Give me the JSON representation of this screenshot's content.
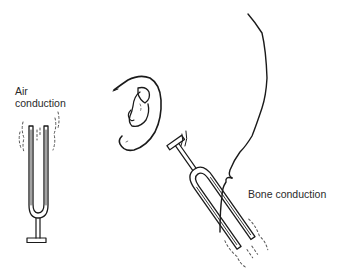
{
  "figure": {
    "type": "illustration",
    "labels": {
      "air_line1": "Air",
      "air_line2": "conduction",
      "bone": "Bone conduction"
    },
    "elements": [
      {
        "name": "air-conduction-tuning-fork",
        "description": "Vertical vibrating tuning fork held in air"
      },
      {
        "name": "ear",
        "description": "Outer ear (auricle) line drawing"
      },
      {
        "name": "head-outline",
        "description": "Back-of-head profile contour"
      },
      {
        "name": "bone-conduction-tuning-fork",
        "description": "Tuning fork with base pressed on mastoid bone behind ear"
      }
    ],
    "colors": {
      "ink": "#1a1a1a",
      "background": "#ffffff"
    }
  }
}
